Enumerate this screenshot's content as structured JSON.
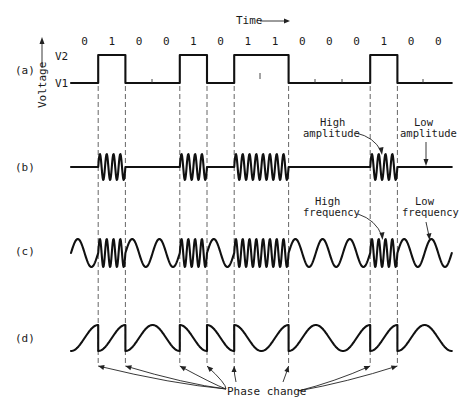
{
  "figure": {
    "axis": {
      "time_label": "Time",
      "voltage_label": "Voltage",
      "v2_label": "V2",
      "v1_label": "V1"
    },
    "bits": [
      "0",
      "1",
      "0",
      "0",
      "1",
      "0",
      "1",
      "1",
      "0",
      "0",
      "0",
      "1",
      "0",
      "0"
    ],
    "rows": {
      "a": {
        "label": "(a)",
        "description": "Binary digital signal"
      },
      "b": {
        "label": "(b)",
        "description": "Amplitude modulation"
      },
      "c": {
        "label": "(c)",
        "description": "Frequency modulation"
      },
      "d": {
        "label": "(d)",
        "description": "Phase modulation"
      }
    },
    "annotations": {
      "high_amplitude": [
        "High",
        "amplitude"
      ],
      "low_amplitude": [
        "Low",
        "amplitude"
      ],
      "high_frequency": [
        "High",
        "frequency"
      ],
      "low_frequency": [
        "Low",
        "frequency"
      ],
      "phase_change": "Phase change"
    },
    "colors": {
      "ink": "#111111",
      "dashes": "#555555",
      "background": "#ffffff"
    }
  }
}
